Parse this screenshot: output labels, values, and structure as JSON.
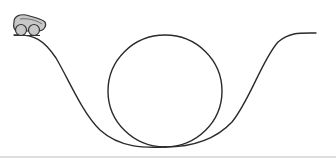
{
  "diagram": {
    "title": "",
    "colors": {
      "track": "#2a2a2a",
      "cart_fill": "#c8c8c8",
      "cart_stroke": "#333333",
      "ground": "#bdbdbd",
      "background": "#ffffff"
    },
    "elements": [
      {
        "id": "cart",
        "label": "cart"
      },
      {
        "id": "left-slope",
        "label": "descending track"
      },
      {
        "id": "loop",
        "label": "loop"
      },
      {
        "id": "right-slope",
        "label": "ascending track"
      },
      {
        "id": "ground-line",
        "label": "ground"
      }
    ]
  }
}
